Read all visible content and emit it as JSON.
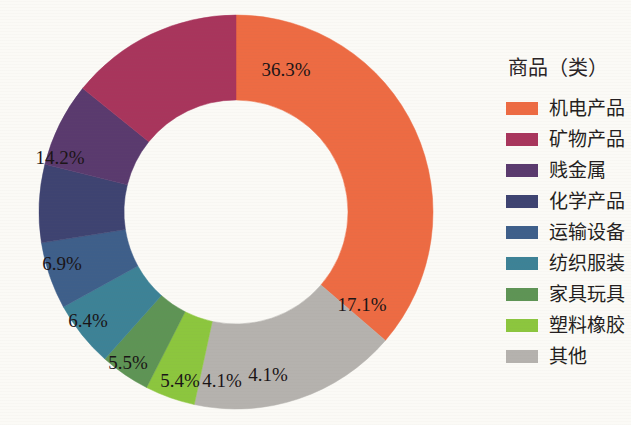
{
  "chart_data": {
    "type": "pie",
    "variant": "donut",
    "title": "",
    "legend_title": "商品（类）",
    "legend_position": "right",
    "start_angle_deg": 0,
    "direction": "clockwise",
    "hole_ratio": 0.57,
    "categories": [
      "机电产品",
      "矿物产品",
      "贱金属",
      "化学产品",
      "运输设备",
      "纺织服装",
      "家具玩具",
      "塑料橡胶",
      "其他"
    ],
    "values": [
      36.3,
      14.2,
      6.9,
      6.4,
      5.5,
      5.4,
      4.1,
      4.1,
      17.1
    ],
    "value_labels": [
      "36.3%",
      "14.2%",
      "6.9%",
      "6.4%",
      "5.5%",
      "5.4%",
      "4.1%",
      "4.1%",
      "17.1%"
    ],
    "colors": [
      "#ED6B43",
      "#A8355C",
      "#5A3A6E",
      "#3E4371",
      "#3E5F8A",
      "#3D8296",
      "#5E9455",
      "#8CC63E",
      "#B5B2AE"
    ],
    "draw_order": [
      "机电产品",
      "其他",
      "塑料橡胶",
      "家具玩具",
      "纺织服装",
      "运输设备",
      "化学产品",
      "贱金属",
      "矿物产品"
    ],
    "unit": "percent",
    "xlabel": "",
    "ylabel": ""
  },
  "legend": {
    "title": "商品（类）",
    "items": [
      {
        "label": "机电产品",
        "color": "#ED6B43"
      },
      {
        "label": "矿物产品",
        "color": "#A8355C"
      },
      {
        "label": "贱金属",
        "color": "#5A3A6E"
      },
      {
        "label": "化学产品",
        "color": "#3E4371"
      },
      {
        "label": "运输设备",
        "color": "#3E5F8A"
      },
      {
        "label": "纺织服装",
        "color": "#3D8296"
      },
      {
        "label": "家具玩具",
        "color": "#5E9455"
      },
      {
        "label": "塑料橡胶",
        "color": "#8CC63E"
      },
      {
        "label": "其他",
        "color": "#B5B2AE"
      }
    ]
  },
  "slices": [
    {
      "label": "机电产品",
      "value_label": "36.3%",
      "color": "#ED6B43",
      "lx": 286,
      "ly": 76
    },
    {
      "label": "其他",
      "value_label": "17.1%",
      "color": "#B5B2AE",
      "lx": 362,
      "ly": 311
    },
    {
      "label": "塑料橡胶",
      "value_label": "4.1%",
      "color": "#8CC63E",
      "lx": 268,
      "ly": 381
    },
    {
      "label": "家具玩具",
      "value_label": "4.1%",
      "color": "#5E9455",
      "lx": 222,
      "ly": 387
    },
    {
      "label": "纺织服装",
      "value_label": "5.4%",
      "color": "#3D8296",
      "lx": 180,
      "ly": 387
    },
    {
      "label": "运输设备",
      "value_label": "5.5%",
      "color": "#3E5F8A",
      "lx": 128,
      "ly": 369
    },
    {
      "label": "化学产品",
      "value_label": "6.4%",
      "color": "#3E4371",
      "lx": 88,
      "ly": 327
    },
    {
      "label": "贱金属",
      "value_label": "6.9%",
      "color": "#5A3A6E",
      "lx": 62,
      "ly": 270
    },
    {
      "label": "矿物产品",
      "value_label": "14.2%",
      "color": "#A8355C",
      "lx": 60,
      "ly": 164
    }
  ],
  "geometry": {
    "cx": 236,
    "cy": 212,
    "r_outer": 197,
    "r_inner": 112
  }
}
